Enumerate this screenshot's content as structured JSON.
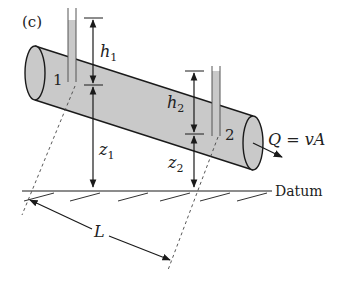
{
  "figure": {
    "panel_label": "(c)",
    "colors": {
      "pipe_fill": "#c9c9c9",
      "tube_fill": "#c9c9c9",
      "stroke": "#1a1a1a"
    },
    "labels": {
      "h1": "h",
      "h1_sub": "1",
      "h2": "h",
      "h2_sub": "2",
      "z1": "z",
      "z1_sub": "1",
      "z2": "z",
      "z2_sub": "2",
      "section1": "1",
      "section2": "2",
      "flow": "Q = vA",
      "datum": "Datum",
      "length": "L"
    }
  }
}
